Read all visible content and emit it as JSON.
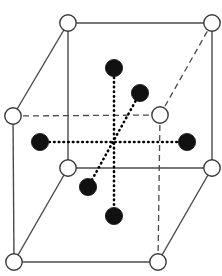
{
  "figure": {
    "name": "crystal-unit-cell-diagram",
    "title": "",
    "width": 222,
    "height": 276,
    "background_color": "#ffffff"
  },
  "style": {
    "solid_edge_color": "#4a4a4a",
    "dashed_edge_color": "#4a4a4a",
    "dotted_bond_color": "#000000",
    "open_atom_fill": "#ffffff",
    "open_atom_stroke": "#3a3a3a",
    "filled_atom_fill": "#111111",
    "filled_atom_stroke": "#111111",
    "solid_edge_width": 1.4,
    "dashed_edge_width": 1.3,
    "dotted_bond_width": 2.6,
    "dash_pattern": "6,4",
    "dot_pattern": "0.5,4.2",
    "open_atom_radius": 8.2,
    "filled_atom_radius": 8.6
  },
  "geometry": {
    "center": {
      "x": 114,
      "y": 142
    },
    "corner_atoms": [
      {
        "id": "front-top-left",
        "label": "corner-atom-front-top-left",
        "x": 68,
        "y": 23,
        "kind": "open"
      },
      {
        "id": "front-top-right",
        "label": "corner-atom-front-top-right",
        "x": 212,
        "y": 23,
        "kind": "open"
      },
      {
        "id": "rear-top-left",
        "label": "corner-atom-rear-top-left",
        "x": 13,
        "y": 116,
        "kind": "open"
      },
      {
        "id": "rear-top-right",
        "label": "corner-atom-rear-top-right",
        "x": 160,
        "y": 115,
        "kind": "open"
      },
      {
        "id": "front-bottom-left",
        "label": "corner-atom-front-bottom-left",
        "x": 68,
        "y": 168,
        "kind": "open"
      },
      {
        "id": "front-bottom-right",
        "label": "corner-atom-front-bottom-right",
        "x": 212,
        "y": 168,
        "kind": "open"
      },
      {
        "id": "rear-bottom-left",
        "label": "corner-atom-rear-bottom-left",
        "x": 14,
        "y": 262,
        "kind": "open"
      },
      {
        "id": "rear-bottom-right",
        "label": "corner-atom-rear-bottom-right",
        "x": 158,
        "y": 262,
        "kind": "open"
      }
    ],
    "interior_atoms": [
      {
        "id": "ligand-up",
        "label": "interior-atom-up",
        "x": 114,
        "y": 68,
        "kind": "filled"
      },
      {
        "id": "ligand-rear-up",
        "label": "interior-atom-rear-upper",
        "x": 140,
        "y": 93,
        "kind": "filled"
      },
      {
        "id": "ligand-left",
        "label": "interior-atom-left",
        "x": 40,
        "y": 142,
        "kind": "filled"
      },
      {
        "id": "ligand-right",
        "label": "interior-atom-right",
        "x": 187,
        "y": 142,
        "kind": "filled"
      },
      {
        "id": "ligand-front-low",
        "label": "interior-atom-front-lower",
        "x": 88,
        "y": 187,
        "kind": "filled"
      },
      {
        "id": "ligand-down",
        "label": "interior-atom-down",
        "x": 114,
        "y": 216,
        "kind": "filled"
      }
    ],
    "solid_edges": [
      {
        "id": "edge-front-top",
        "label": "edge-front-top",
        "x1": 68,
        "y1": 23,
        "x2": 212,
        "y2": 23
      },
      {
        "id": "edge-front-left",
        "label": "edge-front-left",
        "x1": 68,
        "y1": 23,
        "x2": 68,
        "y2": 168
      },
      {
        "id": "edge-front-right",
        "label": "edge-front-right",
        "x1": 212,
        "y1": 23,
        "x2": 212,
        "y2": 168
      },
      {
        "id": "edge-front-bottom",
        "label": "edge-front-bottom",
        "x1": 68,
        "y1": 168,
        "x2": 212,
        "y2": 168
      },
      {
        "id": "edge-top-left-diagonal",
        "label": "edge-top-left-diagonal",
        "x1": 68,
        "y1": 23,
        "x2": 13,
        "y2": 116
      },
      {
        "id": "edge-rear-left-vertical",
        "label": "edge-rear-left-vertical",
        "x1": 13,
        "y1": 116,
        "x2": 14,
        "y2": 262
      },
      {
        "id": "edge-bottom-left-diagonal",
        "label": "edge-bottom-left-diagonal",
        "x1": 68,
        "y1": 168,
        "x2": 14,
        "y2": 262
      },
      {
        "id": "edge-rear-bottom",
        "label": "edge-rear-bottom",
        "x1": 14,
        "y1": 262,
        "x2": 158,
        "y2": 262
      },
      {
        "id": "edge-bottom-right-diagonal",
        "label": "edge-bottom-right-diagonal",
        "x1": 158,
        "y1": 262,
        "x2": 212,
        "y2": 168
      }
    ],
    "dashed_edges": [
      {
        "id": "edge-rear-top",
        "label": "edge-rear-top-hidden",
        "x1": 13,
        "y1": 116,
        "x2": 160,
        "y2": 115
      },
      {
        "id": "edge-rear-right-vertical",
        "label": "edge-rear-right-vertical-hidden",
        "x1": 160,
        "y1": 115,
        "x2": 158,
        "y2": 262
      },
      {
        "id": "edge-top-right-diagonal",
        "label": "edge-top-right-diagonal-hidden",
        "x1": 160,
        "y1": 115,
        "x2": 212,
        "y2": 23
      }
    ],
    "dotted_bonds": [
      {
        "id": "bond-vertical",
        "label": "bond-center-to-up-and-down",
        "x1": 114,
        "y1": 68,
        "x2": 114,
        "y2": 216
      },
      {
        "id": "bond-horizontal",
        "label": "bond-center-to-left-and-right",
        "x1": 40,
        "y1": 142,
        "x2": 187,
        "y2": 142
      },
      {
        "id": "bond-diagonal",
        "label": "bond-center-to-rear-upper-and-front-lower",
        "x1": 140,
        "y1": 93,
        "x2": 88,
        "y2": 187
      }
    ]
  },
  "legend": {
    "open_circle_meaning": "open-circle-atom",
    "filled_circle_meaning": "filled-circle-atom"
  },
  "counts": {
    "corner_atoms": 8,
    "interior_atoms": 6
  }
}
